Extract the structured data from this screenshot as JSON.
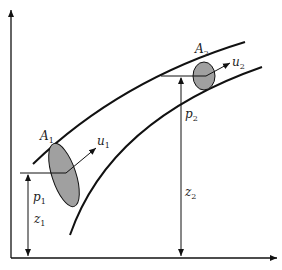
{
  "diagram": {
    "type": "fluid-flow-pipe-bernoulli",
    "colors": {
      "stroke": "#111111",
      "cross_section_fill": "#a0a0a0",
      "background": "#ffffff"
    },
    "section1": {
      "area_label": "A",
      "area_sub": "1",
      "velocity_label": "u",
      "velocity_sub": "1",
      "pressure_label": "p",
      "pressure_sub": "1",
      "height_label": "z",
      "height_sub": "1"
    },
    "section2": {
      "area_label": "A",
      "area_sub": "2",
      "velocity_label": "u",
      "velocity_sub": "2",
      "pressure_label": "p",
      "pressure_sub": "2",
      "height_label": "z",
      "height_sub": "2"
    }
  }
}
